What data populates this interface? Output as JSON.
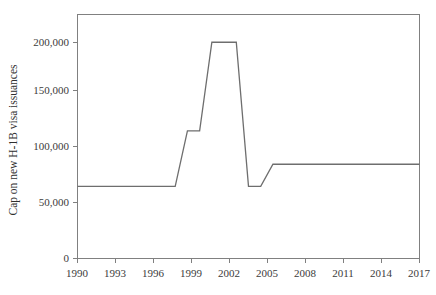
{
  "chart_data": {
    "type": "line",
    "title": "",
    "subtitle": "",
    "xlabel": "",
    "ylabel": "Cap on new H-1B visa issuances",
    "xlim": [
      1990,
      2018
    ],
    "ylim": [
      0,
      220000
    ],
    "grid": false,
    "legend": "none",
    "x_ticks": [
      "1990",
      "1993",
      "1996",
      "1999",
      "2002",
      "2005",
      "2008",
      "2011",
      "2014",
      "2017"
    ],
    "x_tick_values": [
      1990,
      1993,
      1996,
      1999,
      2002,
      2005,
      2008,
      2011,
      2014,
      2017
    ],
    "y_ticks": [
      "0",
      "50,000",
      "100,000",
      "150,000",
      "200,000"
    ],
    "y_tick_values": [
      0,
      50000,
      100000,
      150000,
      200000
    ],
    "x": [
      1990,
      1991,
      1992,
      1993,
      1994,
      1995,
      1996,
      1997,
      1998,
      1999,
      2000,
      2001,
      2002,
      2003,
      2004,
      2005,
      2006,
      2007,
      2008,
      2009,
      2010,
      2011,
      2012,
      2013,
      2014,
      2015,
      2016,
      2017,
      2018
    ],
    "values": [
      65000,
      65000,
      65000,
      65000,
      65000,
      65000,
      65000,
      65000,
      65000,
      115000,
      115000,
      195000,
      195000,
      195000,
      65000,
      65000,
      85000,
      85000,
      85000,
      85000,
      85000,
      85000,
      85000,
      85000,
      85000,
      85000,
      85000,
      85000,
      85000
    ],
    "series": [
      {
        "name": "Cap on new H-1B visa issuances",
        "color": "#6e6e6e",
        "values": [
          65000,
          65000,
          65000,
          65000,
          65000,
          65000,
          65000,
          65000,
          65000,
          115000,
          115000,
          195000,
          195000,
          195000,
          65000,
          65000,
          85000,
          85000,
          85000,
          85000,
          85000,
          85000,
          85000,
          85000,
          85000,
          85000,
          85000,
          85000,
          85000
        ]
      }
    ],
    "annotations": []
  },
  "colors": {
    "line": "#6e6e6e",
    "axis": "#808080",
    "text": "#3b3b3b",
    "background": "#ffffff"
  }
}
